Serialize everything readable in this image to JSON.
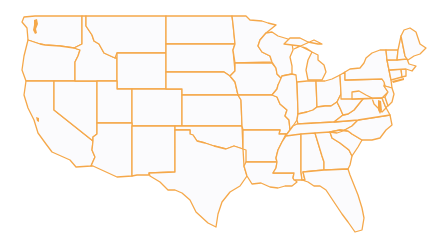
{
  "map": {
    "title": "United States Map",
    "region": "Contiguous United States",
    "style": "state outlines",
    "colors": {
      "stroke": "#f5a84a",
      "fill": "#fbfbfd",
      "background": "#ffffff"
    },
    "states": [
      {
        "id": "WA",
        "name": "Washington",
        "points": "35,16 82,16 82,44 74,48 60,46 45,45 40,44 28,40 27,28 22,22 24,17"
      },
      {
        "id": "OR",
        "name": "Oregon",
        "points": "28,40 40,44 45,45 60,46 74,48 80,50 78,56 75,62 75,81 26,81 22,70 24,56"
      },
      {
        "id": "CA",
        "name": "California",
        "points": "26,81 54,81 54,110 93,141 92,150 95,157 91,166 76,167 70,160 52,152 46,144 38,133 34,120 28,108 24,95"
      },
      {
        "id": "NV",
        "name": "Nevada",
        "points": "54,81 97,81 97,134 93,137 93,141 54,110"
      },
      {
        "id": "ID",
        "name": "Idaho",
        "points": "82,16 86,16 86,26 92,35 94,41 99,44 104,53 115,58 117,58 117,81 75,81 75,62 78,56 80,50 74,48 82,44"
      },
      {
        "id": "MT",
        "name": "Montana",
        "points": "86,16 166,16 166,53 117,53 115,58 104,53 99,44 94,41 92,35 86,26"
      },
      {
        "id": "WY",
        "name": "Wyoming",
        "points": "117,53 166,53 166,89 117,89"
      },
      {
        "id": "UT",
        "name": "Utah",
        "points": "97,81 117,81 117,89 132,89 132,123 97,123"
      },
      {
        "id": "CO",
        "name": "Colorado",
        "points": "132,89 182,89 182,126 132,126"
      },
      {
        "id": "AZ",
        "name": "Arizona",
        "points": "97,123 132,123 132,176 117,177 93,166 91,166 95,157 92,150 93,141 93,137 97,134"
      },
      {
        "id": "NM",
        "name": "New Mexico",
        "points": "132,126 175,126 175,172 149,173 149,175 137,175 132,176"
      },
      {
        "id": "ND",
        "name": "North Dakota",
        "points": "166,16 232,16 233,24 235,44 166,44"
      },
      {
        "id": "SD",
        "name": "South Dakota",
        "points": "166,44 235,44 233,50 235,71 230,76 224,72 166,72"
      },
      {
        "id": "NE",
        "name": "Nebraska",
        "points": "166,72 224,72 230,76 235,82 238,95 182,95 182,89 166,89"
      },
      {
        "id": "KS",
        "name": "Kansas",
        "points": "182,95 238,95 241,100 242,126 182,126"
      },
      {
        "id": "OK",
        "name": "Oklahoma",
        "points": "175,126 242,126 243,149 234,146 226,149 214,146 205,143 197,141 193,135 190,134 190,130 175,130"
      },
      {
        "id": "TX",
        "name": "Texas",
        "points": "175,130 190,130 190,134 193,135 197,141 205,143 214,146 226,149 234,146 243,149 244,166 247,176 240,186 230,192 222,202 218,214 216,227 208,223 196,212 190,200 182,193 175,190 168,190 160,182 150,176 149,173 175,172"
      },
      {
        "id": "MN",
        "name": "Minnesota",
        "points": "232,16 246,16 250,20 262,21 268,23 276,25 266,33 260,40 258,46 262,52 270,56 272,62 235,63 233,50 235,44 233,24"
      },
      {
        "id": "IA",
        "name": "Iowa",
        "points": "235,63 272,63 276,68 277,74 282,79 278,85 277,89 272,95 238,95 235,82 230,76 235,71"
      },
      {
        "id": "MO",
        "name": "Missouri",
        "points": "238,95 272,95 277,97 280,104 287,110 285,116 289,120 290,130 287,134 279,134 280,130 243,130 242,126 241,100"
      },
      {
        "id": "AR",
        "name": "Arkansas",
        "points": "243,130 280,130 279,134 286,134 282,142 278,150 276,158 277,162 246,162 246,150 243,149"
      },
      {
        "id": "LA",
        "name": "Louisiana",
        "points": "246,162 277,162 276,168 273,173 294,173 293,178 297,182 292,186 285,186 278,188 270,187 261,183 252,184 247,176 244,166"
      },
      {
        "id": "WI",
        "name": "Wisconsin",
        "points": "266,33 272,32 278,36 288,39 292,43 293,50 290,57 292,66 292,74 282,76 282,79 277,74 276,68 272,62 270,56 262,52 258,46 260,40"
      },
      {
        "id": "IL",
        "name": "Illinois",
        "points": "282,76 292,74 296,75 297,85 298,112 297,120 293,126 290,130 289,120 285,116 287,110 280,104 277,97 272,95 277,89 278,85"
      },
      {
        "id": "MI",
        "name": "Michigan",
        "points": "294,49 300,46 306,48 312,52 308,60 306,70 308,80 322,80 326,72 324,65 318,60 318,55 312,52 300,46 284,44 290,38 300,38 308,42 318,44 322,44 314,40"
      },
      {
        "id": "IN",
        "name": "Indiana",
        "points": "297,82 307,81 316,81 317,107 313,110 307,112 298,114 298,112"
      },
      {
        "id": "OH",
        "name": "Ohio",
        "points": "316,81 325,81 332,79 340,75 341,94 337,102 331,106 325,106 317,107"
      },
      {
        "id": "KY",
        "name": "Kentucky",
        "points": "297,120 298,114 307,112 313,110 317,107 325,106 331,106 337,102 340,108 343,115 334,122 298,124"
      },
      {
        "id": "TN",
        "name": "Tennessee",
        "points": "287,134 290,130 293,126 297,124 334,122 358,120 352,126 343,131 337,133 286,136"
      },
      {
        "id": "MS",
        "name": "Mississippi",
        "points": "286,136 301,134 301,172 302,180 294,180 293,178 294,173 273,173 276,168 277,162 276,158 278,150 282,142"
      },
      {
        "id": "AL",
        "name": "Alabama",
        "points": "301,134 315,133 322,156 324,162 324,170 303,172 305,180 302,180 301,172"
      },
      {
        "id": "GA",
        "name": "Georgia",
        "points": "315,133 330,132 332,138 340,143 349,150 352,156 350,165 348,169 326,170 324,170 324,162 322,156"
      },
      {
        "id": "FL",
        "name": "Florida",
        "points": "303,172 324,170 326,170 348,169 350,175 354,185 358,195 362,208 364,218 362,230 355,232 348,222 342,214 336,205 330,196 326,190 320,186 314,186 308,182 302,180 305,180"
      },
      {
        "id": "SC",
        "name": "South Carolina",
        "points": "330,132 340,130 348,131 352,134 362,140 358,147 352,156 349,150 340,143 332,138"
      },
      {
        "id": "NC",
        "name": "North Carolina",
        "points": "337,133 343,131 352,126 358,120 390,115 392,125 386,130 380,138 372,140 362,140 352,134 348,131 340,130 330,132"
      },
      {
        "id": "VA",
        "name": "Virginia",
        "points": "334,122 343,115 348,114 354,110 362,100 366,95 372,98 378,100 384,104 390,115 358,120"
      },
      {
        "id": "WV",
        "name": "West Virginia",
        "points": "337,102 341,94 343,97 349,96 352,92 359,91 366,95 362,100 354,110 348,114 343,115 340,108"
      },
      {
        "id": "PA",
        "name": "Pennsylvania",
        "points": "340,75 345,72 345,80 382,79 385,82 384,86 388,92 382,98 352,99 341,99 341,94"
      },
      {
        "id": "NY",
        "name": "New York",
        "points": "345,72 350,69 360,68 364,63 366,58 372,53 380,50 386,50 387,60 389,70 391,80 392,88 385,86 384,82 382,79 345,80"
      },
      {
        "id": "MD",
        "name": "Maryland",
        "points": "352,99 382,98 386,108 382,112 378,108 374,104 372,98 366,95 359,91 352,92"
      },
      {
        "id": "DE",
        "name": "Delaware",
        "points": "382,98 385,97 388,105 386,108"
      },
      {
        "id": "NJ",
        "name": "New Jersey",
        "points": "385,86 392,88 394,94 392,102 388,106 385,97 388,92 384,86"
      },
      {
        "id": "CT",
        "name": "Connecticut",
        "points": "389,70 401,69 402,77 391,80"
      },
      {
        "id": "RI",
        "name": "Rhode Island",
        "points": "401,69 406,69 406,76 402,77"
      },
      {
        "id": "MA",
        "name": "Massachusetts",
        "points": "387,60 407,59 409,64 416,66 412,71 406,69 389,70"
      },
      {
        "id": "VT",
        "name": "Vermont",
        "points": "386,50 398,50 397,60 387,60"
      },
      {
        "id": "NH",
        "name": "New Hampshire",
        "points": "398,50 401,36 403,46 405,56 407,59 397,60"
      },
      {
        "id": "ME",
        "name": "Maine",
        "points": "401,36 404,30 410,28 416,32 420,44 426,48 420,54 414,56 408,60 407,59 405,56 403,46"
      }
    ]
  }
}
